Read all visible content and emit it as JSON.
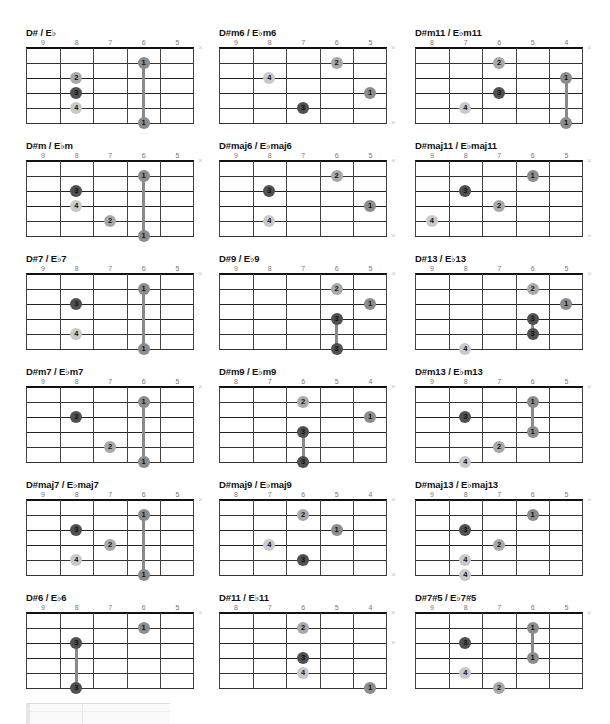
{
  "page": {
    "layout": {
      "columns_x": [
        26,
        219,
        415
      ],
      "rows_y": [
        27,
        140,
        253,
        366,
        479,
        592
      ]
    }
  },
  "dot_colors": {
    "1": "#8c8c8c",
    "2": "#a9a9a9",
    "3": "#505050",
    "4": "#c9c9c9"
  },
  "chords": [
    {
      "name": "D# / E♭",
      "frets": [
        "9",
        "8",
        "7",
        "6",
        "5"
      ],
      "dots": [
        [
          1,
          3,
          "1"
        ],
        [
          2,
          1,
          "2"
        ],
        [
          3,
          1,
          "3"
        ],
        [
          4,
          1,
          "4"
        ],
        [
          5,
          3,
          "1"
        ]
      ],
      "barres": [
        [
          3,
          1,
          5
        ]
      ],
      "mutes": [
        0
      ]
    },
    {
      "name": "D#m6 / E♭m6",
      "frets": [
        "9",
        "8",
        "7",
        "6",
        "5"
      ],
      "dots": [
        [
          1,
          3,
          "2"
        ],
        [
          2,
          1,
          "4"
        ],
        [
          3,
          4,
          "1"
        ],
        [
          4,
          2,
          "3"
        ]
      ],
      "barres": [],
      "mutes": [
        0,
        5
      ]
    },
    {
      "name": "D#m11 / E♭m11",
      "frets": [
        "8",
        "7",
        "6",
        "5",
        "4"
      ],
      "dots": [
        [
          1,
          2,
          "2"
        ],
        [
          2,
          4,
          "1"
        ],
        [
          3,
          2,
          "3"
        ],
        [
          4,
          1,
          "4"
        ],
        [
          5,
          4,
          "1"
        ]
      ],
      "barres": [
        [
          4,
          2,
          5
        ]
      ],
      "mutes": [
        0
      ]
    },
    {
      "name": "D#m / E♭m",
      "frets": [
        "9",
        "8",
        "7",
        "6",
        "5"
      ],
      "dots": [
        [
          1,
          3,
          "1"
        ],
        [
          2,
          1,
          "3"
        ],
        [
          3,
          1,
          "4"
        ],
        [
          4,
          2,
          "2"
        ],
        [
          5,
          3,
          "1"
        ]
      ],
      "barres": [
        [
          3,
          1,
          5
        ]
      ],
      "mutes": [
        0
      ]
    },
    {
      "name": "D#maj6 / E♭maj6",
      "frets": [
        "9",
        "8",
        "7",
        "6",
        "5"
      ],
      "dots": [
        [
          1,
          3,
          "2"
        ],
        [
          2,
          1,
          "3"
        ],
        [
          3,
          4,
          "1"
        ],
        [
          4,
          1,
          "4"
        ]
      ],
      "barres": [],
      "mutes": [
        0,
        5
      ]
    },
    {
      "name": "D#maj11 / E♭maj11",
      "frets": [
        "9",
        "8",
        "7",
        "6",
        "5"
      ],
      "dots": [
        [
          1,
          3,
          "1"
        ],
        [
          2,
          1,
          "3"
        ],
        [
          3,
          2,
          "2"
        ],
        [
          4,
          0,
          "4"
        ]
      ],
      "barres": [],
      "mutes": [
        0,
        5
      ]
    },
    {
      "name": "D#7 / E♭7",
      "frets": [
        "9",
        "8",
        "7",
        "6",
        "5"
      ],
      "dots": [
        [
          1,
          3,
          "1"
        ],
        [
          2,
          1,
          "3"
        ],
        [
          4,
          1,
          "4"
        ],
        [
          5,
          3,
          "1"
        ]
      ],
      "barres": [
        [
          3,
          1,
          5
        ]
      ],
      "mutes": [
        0
      ]
    },
    {
      "name": "D#9 / E♭9",
      "frets": [
        "9",
        "8",
        "7",
        "6",
        "5"
      ],
      "dots": [
        [
          1,
          3,
          "2"
        ],
        [
          2,
          4,
          "1"
        ],
        [
          3,
          3,
          "3"
        ],
        [
          5,
          3,
          "3"
        ]
      ],
      "barres": [
        [
          3,
          3,
          5
        ]
      ],
      "mutes": [
        0
      ]
    },
    {
      "name": "D#13 / E♭13",
      "frets": [
        "9",
        "8",
        "7",
        "6",
        "5"
      ],
      "dots": [
        [
          1,
          3,
          "2"
        ],
        [
          2,
          4,
          "1"
        ],
        [
          3,
          3,
          "3"
        ],
        [
          4,
          3,
          "3"
        ],
        [
          5,
          1,
          "4"
        ]
      ],
      "barres": [
        [
          3,
          3,
          4
        ]
      ],
      "mutes": [
        0
      ]
    },
    {
      "name": "D#m7 / E♭m7",
      "frets": [
        "9",
        "8",
        "7",
        "6",
        "5"
      ],
      "dots": [
        [
          1,
          3,
          "1"
        ],
        [
          2,
          1,
          "3"
        ],
        [
          4,
          2,
          "2"
        ],
        [
          5,
          3,
          "1"
        ]
      ],
      "barres": [
        [
          3,
          1,
          5
        ]
      ],
      "mutes": [
        0
      ]
    },
    {
      "name": "D#m9 / E♭m9",
      "frets": [
        "8",
        "7",
        "6",
        "5",
        "4"
      ],
      "dots": [
        [
          1,
          2,
          "2"
        ],
        [
          2,
          4,
          "1"
        ],
        [
          3,
          2,
          "3"
        ],
        [
          5,
          2,
          "3"
        ]
      ],
      "barres": [
        [
          2,
          3,
          5
        ]
      ],
      "mutes": [
        0
      ]
    },
    {
      "name": "D#m13 / E♭m13",
      "frets": [
        "9",
        "8",
        "7",
        "6",
        "5"
      ],
      "dots": [
        [
          1,
          3,
          "1"
        ],
        [
          2,
          1,
          "3"
        ],
        [
          3,
          3,
          "1"
        ],
        [
          4,
          2,
          "2"
        ],
        [
          5,
          1,
          "4"
        ]
      ],
      "barres": [
        [
          3,
          1,
          3
        ]
      ],
      "mutes": [
        0
      ]
    },
    {
      "name": "D#maj7 / E♭maj7",
      "frets": [
        "9",
        "8",
        "7",
        "6",
        "5"
      ],
      "dots": [
        [
          1,
          3,
          "1"
        ],
        [
          2,
          1,
          "3"
        ],
        [
          3,
          2,
          "2"
        ],
        [
          4,
          1,
          "4"
        ],
        [
          5,
          3,
          "1"
        ]
      ],
      "barres": [
        [
          3,
          1,
          5
        ]
      ],
      "mutes": [
        0
      ]
    },
    {
      "name": "D#maj9 / E♭maj9",
      "frets": [
        "8",
        "7",
        "6",
        "5",
        "4"
      ],
      "dots": [
        [
          1,
          2,
          "2"
        ],
        [
          2,
          3,
          "1"
        ],
        [
          3,
          1,
          "4"
        ],
        [
          4,
          2,
          "3"
        ]
      ],
      "barres": [],
      "mutes": [
        0,
        5
      ]
    },
    {
      "name": "D#maj13 / E♭maj13",
      "frets": [
        "9",
        "8",
        "7",
        "6",
        "5"
      ],
      "dots": [
        [
          1,
          3,
          "1"
        ],
        [
          2,
          1,
          "3"
        ],
        [
          3,
          2,
          "2"
        ],
        [
          4,
          1,
          "4"
        ],
        [
          5,
          1,
          "4"
        ]
      ],
      "barres": [],
      "mutes": [
        0
      ]
    },
    {
      "name": "D#6 / E♭6",
      "frets": [
        "9",
        "8",
        "7",
        "6",
        "5"
      ],
      "dots": [
        [
          1,
          3,
          "1"
        ],
        [
          2,
          1,
          "3"
        ],
        [
          5,
          1,
          "3"
        ]
      ],
      "barres": [
        [
          1,
          2,
          5
        ]
      ],
      "mutes": [
        0
      ]
    },
    {
      "name": "D#11 / E♭11",
      "frets": [
        "8",
        "7",
        "6",
        "5",
        "4"
      ],
      "dots": [
        [
          1,
          2,
          "2"
        ],
        [
          3,
          2,
          "3"
        ],
        [
          4,
          2,
          "4"
        ],
        [
          5,
          4,
          "1"
        ]
      ],
      "barres": [],
      "mutes": [
        0,
        2
      ]
    },
    {
      "name": "D#7#5 / E♭7#5",
      "frets": [
        "9",
        "8",
        "7",
        "6",
        "5"
      ],
      "dots": [
        [
          1,
          3,
          "1"
        ],
        [
          2,
          1,
          "3"
        ],
        [
          3,
          3,
          "1"
        ],
        [
          4,
          1,
          "4"
        ],
        [
          5,
          2,
          "2"
        ]
      ],
      "barres": [
        [
          3,
          1,
          3
        ]
      ],
      "mutes": [
        0
      ]
    }
  ],
  "icons": {
    "mute": "×"
  }
}
